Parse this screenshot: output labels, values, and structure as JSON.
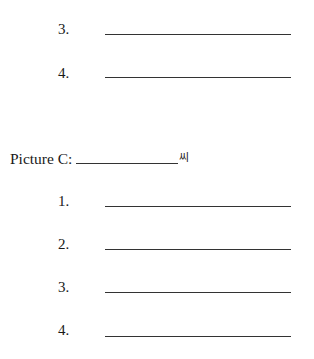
{
  "top_section": {
    "items": [
      {
        "number": "3."
      },
      {
        "number": "4."
      }
    ]
  },
  "picture_c": {
    "label": "Picture C:",
    "suffix": "씨",
    "items": [
      {
        "number": "1."
      },
      {
        "number": "2."
      },
      {
        "number": "3."
      },
      {
        "number": "4."
      }
    ]
  }
}
